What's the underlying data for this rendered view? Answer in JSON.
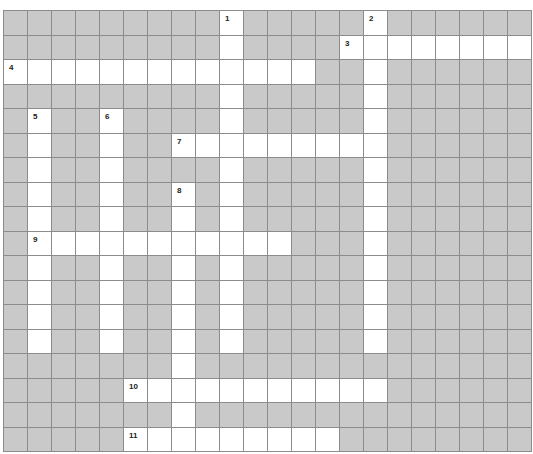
{
  "puzzle": {
    "cols": 22,
    "rows": 18,
    "colors": {
      "block": "#c9c9c9",
      "open": "#ffffff",
      "line": "#8c8c8c"
    },
    "entries": [
      {
        "number": 1,
        "direction": "down",
        "row": 0,
        "col": 9,
        "length": 14
      },
      {
        "number": 2,
        "direction": "down",
        "row": 0,
        "col": 15,
        "length": 14
      },
      {
        "number": 3,
        "direction": "across",
        "row": 1,
        "col": 14,
        "length": 8
      },
      {
        "number": 4,
        "direction": "across",
        "row": 2,
        "col": 0,
        "length": 13
      },
      {
        "number": 5,
        "direction": "down",
        "row": 4,
        "col": 1,
        "length": 10
      },
      {
        "number": 6,
        "direction": "down",
        "row": 4,
        "col": 4,
        "length": 10
      },
      {
        "number": 7,
        "direction": "across",
        "row": 5,
        "col": 7,
        "length": 9
      },
      {
        "number": 8,
        "direction": "down",
        "row": 7,
        "col": 7,
        "length": 10
      },
      {
        "number": 9,
        "direction": "across",
        "row": 9,
        "col": 1,
        "length": 11
      },
      {
        "number": 10,
        "direction": "across",
        "row": 15,
        "col": 5,
        "length": 11
      },
      {
        "number": 11,
        "direction": "across",
        "row": 17,
        "col": 5,
        "length": 9
      }
    ]
  }
}
